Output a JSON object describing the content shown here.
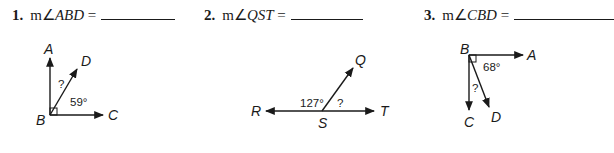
{
  "problems": [
    {
      "number": "1.",
      "prefix": "m∠",
      "angle": "ABD",
      "equals": "=",
      "diagram": {
        "labels": {
          "vertex": "B",
          "ray1": "A",
          "ray2": "D",
          "ray3": "C"
        },
        "given_angle": "59°",
        "unknown": "?",
        "right_angle_at": "B"
      }
    },
    {
      "number": "2.",
      "prefix": "m∠",
      "angle": "QST",
      "equals": "=",
      "diagram": {
        "labels": {
          "vertex": "S",
          "ray1": "R",
          "ray2": "Q",
          "ray3": "T"
        },
        "given_angle": "127°",
        "unknown": "?"
      }
    },
    {
      "number": "3.",
      "prefix": "m∠",
      "angle": "CBD",
      "equals": "=",
      "diagram": {
        "labels": {
          "vertex": "B",
          "ray1": "A",
          "ray2": "D",
          "ray3": "C"
        },
        "given_angle": "68°",
        "unknown": "?",
        "right_angle_at": "B"
      }
    }
  ]
}
